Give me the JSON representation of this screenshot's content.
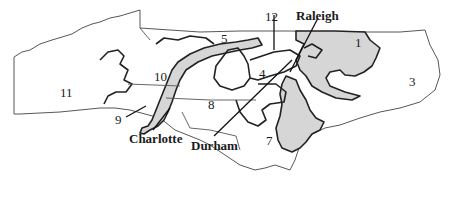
{
  "map": {
    "subject": "North Carolina congressional districts",
    "colors": {
      "background": "#ffffff",
      "shaded_district": "#d6d6d6",
      "outline": "#222222"
    },
    "district_labels": [
      {
        "id": "1",
        "text": "1",
        "x": 358,
        "y": 40
      },
      {
        "id": "3",
        "text": "3",
        "x": 410,
        "y": 78
      },
      {
        "id": "4",
        "text": "4",
        "x": 258,
        "y": 68
      },
      {
        "id": "5",
        "text": "5",
        "x": 222,
        "y": 33
      },
      {
        "id": "7",
        "text": "7",
        "x": 266,
        "y": 135
      },
      {
        "id": "8",
        "text": "8",
        "x": 207,
        "y": 99
      },
      {
        "id": "9",
        "text": "9",
        "x": 116,
        "y": 115
      },
      {
        "id": "10",
        "text": "10",
        "x": 155,
        "y": 72
      },
      {
        "id": "11",
        "text": "11",
        "x": 62,
        "y": 88
      },
      {
        "id": "12",
        "text": "12",
        "x": 266,
        "y": 11
      }
    ],
    "city_labels": [
      {
        "id": "raleigh",
        "text": "Raleigh",
        "x": 296,
        "y": 10
      },
      {
        "id": "charlotte",
        "text": "Charlotte",
        "x": 130,
        "y": 133
      },
      {
        "id": "durham",
        "text": "Durham",
        "x": 191,
        "y": 140
      }
    ]
  }
}
